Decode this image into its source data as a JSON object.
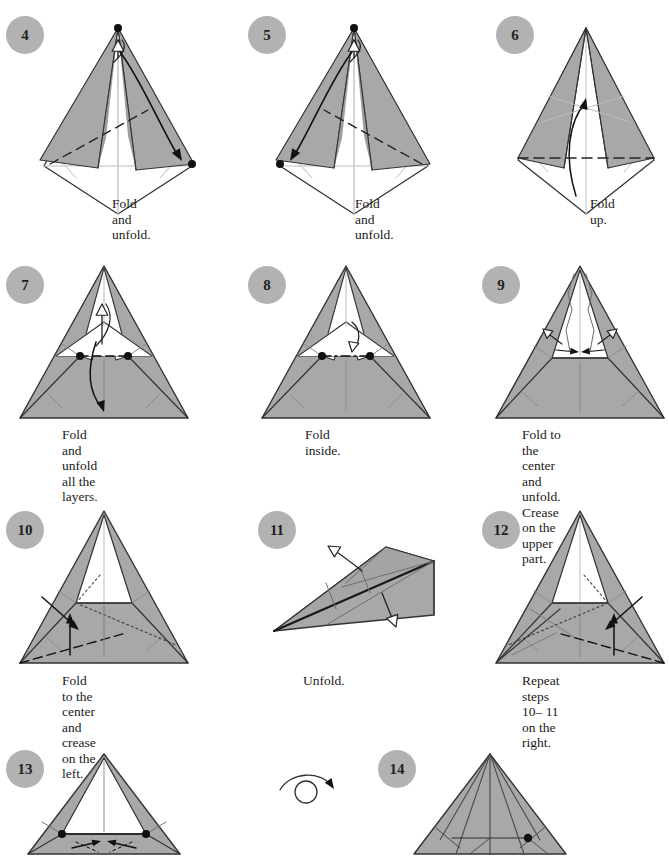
{
  "page": {
    "width": 660,
    "height": 854,
    "background": "#ffffff",
    "paper_front_color": "#a8a8a8",
    "paper_back_color": "#ffffff",
    "line_color": "#333333",
    "badge_color": "#b2b2b2",
    "badge_text_color": "#222222"
  },
  "symbols": {
    "turn_over": "turn-over-arrow",
    "valley_fold": "dashed-line",
    "mountain_fold": "dash-dot-line",
    "existing_crease": "thin-solid-line",
    "hidden_edge": "dotted-line",
    "fold_arrow": "solid-head-arrow",
    "unfold_arrow": "hollow-head-arrow"
  },
  "steps": [
    {
      "number": "4",
      "caption": "Fold and unfold.",
      "badge": {
        "x": 6,
        "y": 16
      },
      "caption_pos": {
        "x": 112,
        "y": 196
      },
      "figure": {
        "x": 36,
        "y": 18,
        "w": 160,
        "h": 195
      },
      "shape": "kite-tall",
      "arrows": [
        "unfold-up-at-apex",
        "fold-down-right"
      ],
      "creases": [
        "valley-diagonal-left"
      ],
      "dots": [
        "apex",
        "right-corner"
      ]
    },
    {
      "number": "5",
      "caption": "Fold and unfold.",
      "badge": {
        "x": 248,
        "y": 16
      },
      "caption_pos": {
        "x": 355,
        "y": 196
      },
      "figure": {
        "x": 272,
        "y": 18,
        "w": 160,
        "h": 195
      },
      "shape": "kite-tall-mirrored",
      "arrows": [
        "unfold-up-at-apex",
        "fold-down-left"
      ],
      "creases": [
        "valley-diagonal-right"
      ],
      "dots": [
        "apex",
        "left-corner"
      ]
    },
    {
      "number": "6",
      "caption": "Fold up.",
      "badge": {
        "x": 496,
        "y": 16
      },
      "caption_pos": {
        "x": 590,
        "y": 196
      },
      "figure": {
        "x": 512,
        "y": 18,
        "w": 140,
        "h": 195
      },
      "shape": "kite-wide",
      "arrows": [
        "fold-up-curved"
      ],
      "creases": [
        "valley-horizontal"
      ],
      "dots": []
    },
    {
      "number": "7",
      "caption": "Fold and unfold\nall the layers.",
      "badge": {
        "x": 6,
        "y": 266
      },
      "caption_pos": {
        "x": 62,
        "y": 427
      },
      "figure": {
        "x": 14,
        "y": 260
      },
      "shape": "triangle-open-top",
      "arrows": [
        "unfold-up-inner",
        "fold-down-long"
      ],
      "creases": [
        "valley-short-horizontal"
      ],
      "dots": [
        "left-mid",
        "right-mid"
      ]
    },
    {
      "number": "8",
      "caption": "Fold inside.",
      "badge": {
        "x": 248,
        "y": 266
      },
      "caption_pos": {
        "x": 305,
        "y": 427
      },
      "figure": {
        "x": 256,
        "y": 260
      },
      "shape": "triangle-open-top",
      "arrows": [
        "push-inside"
      ],
      "creases": [
        "mountain-short-horizontal"
      ],
      "dots": [
        "left-mid",
        "right-mid"
      ]
    },
    {
      "number": "9",
      "caption": "Fold to the center\nand unfold. Crease\non the upper part.",
      "badge": {
        "x": 482,
        "y": 266
      },
      "caption_pos": {
        "x": 522,
        "y": 427
      },
      "figure": {
        "x": 490,
        "y": 260
      },
      "shape": "triangle-flat-pocket",
      "arrows": [
        "two-in-two-out"
      ],
      "creases": [],
      "dots": []
    },
    {
      "number": "10",
      "caption": "Fold to the center and\ncrease on the left.",
      "badge": {
        "x": 6,
        "y": 511
      },
      "caption_pos": {
        "x": 62,
        "y": 673
      },
      "figure": {
        "x": 14,
        "y": 505
      },
      "shape": "triangle-flat-pocket",
      "arrows": [
        "fold-left-down",
        "fold-left-up"
      ],
      "creases": [
        "valley-lower-left",
        "dotted-right"
      ],
      "dots": []
    },
    {
      "number": "11",
      "caption": "Unfold.",
      "badge": {
        "x": 258,
        "y": 511
      },
      "caption_pos": {
        "x": 303,
        "y": 673
      },
      "figure": {
        "x": 266,
        "y": 505
      },
      "shape": "flat-wedge-3d",
      "arrows": [
        "unfold-upper-left",
        "unfold-lower-right"
      ],
      "creases": [],
      "dots": []
    },
    {
      "number": "12",
      "caption": "Repeat steps 10– 11\non the right.",
      "badge": {
        "x": 482,
        "y": 511
      },
      "caption_pos": {
        "x": 522,
        "y": 673
      },
      "figure": {
        "x": 490,
        "y": 505
      },
      "shape": "triangle-flat-pocket-creased-left",
      "arrows": [
        "fold-right-down",
        "fold-right-up"
      ],
      "creases": [
        "valley-lower-right",
        "dotted-left"
      ],
      "dots": []
    },
    {
      "number": "13",
      "caption": "",
      "badge": {
        "x": 6,
        "y": 750
      },
      "caption_pos": {
        "x": 62,
        "y": 918
      },
      "figure": {
        "x": 14,
        "y": 748
      },
      "shape": "triangle-narrow-pocket",
      "arrows": [
        "inward-pair"
      ],
      "creases": [],
      "dots": [
        "left-mid",
        "right-mid"
      ]
    },
    {
      "number": "14",
      "caption": "",
      "badge": {
        "x": 378,
        "y": 750
      },
      "caption_pos": {
        "x": 434,
        "y": 918
      },
      "figure": {
        "x": 400,
        "y": 748
      },
      "shape": "triangle-creased-all",
      "arrows": [],
      "creases": [],
      "dots": [
        "right-mid"
      ]
    }
  ],
  "turn_over_symbol": {
    "x": 276,
    "y": 768,
    "label": "turn-over-arrow"
  }
}
